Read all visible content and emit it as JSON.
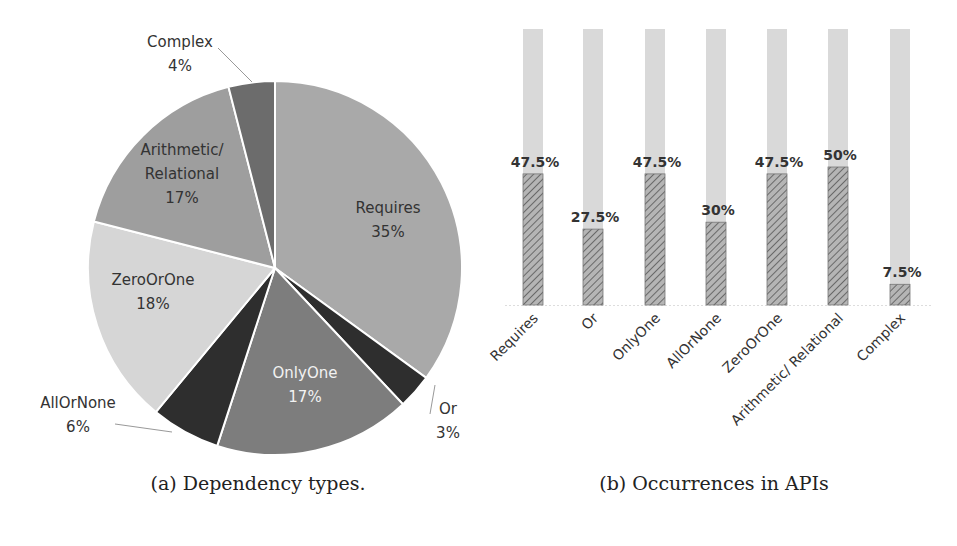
{
  "chart_data": [
    {
      "type": "pie",
      "title": "(a) Dependency types.",
      "categories": [
        "Requires",
        "Or",
        "OnlyOne",
        "AllOrNone",
        "ZeroOrOne",
        "Arithmetic/ Relational",
        "Complex"
      ],
      "values": [
        35,
        3,
        17,
        6,
        18,
        17,
        4
      ],
      "labels": [
        "Requires\n35%",
        "Or\n3%",
        "OnlyOne\n17%",
        "AllOrNone\n6%",
        "ZeroOrOne\n18%",
        "Arithmetic/\nRelational\n17%",
        "Complex\n4%"
      ],
      "colors": [
        "#a9a9a9",
        "#2e2e2e",
        "#7d7d7d",
        "#2e2e2e",
        "#d6d6d6",
        "#9e9e9e",
        "#6c6c6c"
      ],
      "start_angle": "12 o'clock, clockwise"
    },
    {
      "type": "bar",
      "title": "(b) Occurrences in APIs",
      "categories": [
        "Requires",
        "Or",
        "OnlyOne",
        "AllOrNone",
        "ZeroOrOne",
        "Arithmetic/ Relational",
        "Complex"
      ],
      "values": [
        47.5,
        27.5,
        47.5,
        30,
        47.5,
        50,
        7.5
      ],
      "value_labels": [
        "47.5%",
        "27.5%",
        "47.5%",
        "30%",
        "47.5%",
        "50%",
        "7.5%"
      ],
      "background_bar": 100,
      "ylim": [
        0,
        100
      ],
      "xlabel": "",
      "ylabel": "",
      "grid": false,
      "legend": "none",
      "bar_fill": "diagonal hatch (gray)",
      "background_color": "#d9d9d9"
    }
  ],
  "captions": {
    "a": "(a) Dependency types.",
    "b": "(b) Occurrences in APIs"
  }
}
